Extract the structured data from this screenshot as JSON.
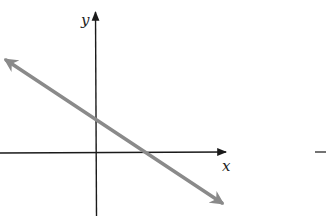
{
  "diagram": {
    "type": "coordinate-plane-line",
    "axes": {
      "x_label": "x",
      "y_label": "y",
      "axis_color": "#1a1a1a"
    },
    "line": {
      "description": "straight line with negative slope, positive y-intercept and positive x-intercept, arrows on both ends",
      "color": "#8a8a8a",
      "slope_sign": "negative",
      "y_intercept_sign": "positive",
      "x_intercept_sign": "positive"
    },
    "extra_mark": {
      "symbol": "–",
      "color": "#444444"
    }
  }
}
